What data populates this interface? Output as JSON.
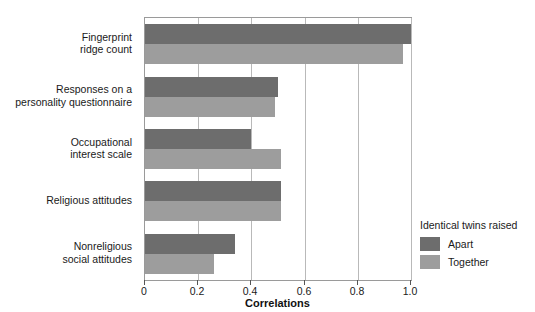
{
  "chart_data": {
    "type": "bar",
    "orientation": "horizontal",
    "title": "",
    "xlabel": "Correlations",
    "ylabel": "",
    "xlim": [
      0,
      1.0
    ],
    "xticks": [
      0,
      0.2,
      0.4,
      0.6,
      0.8,
      1.0
    ],
    "xticklabels": [
      "0",
      "0.2",
      "0.4",
      "0.6",
      "0.8",
      "1.0"
    ],
    "grid": "vertical",
    "legend_position": "right",
    "legend_title": "Identical twins raised",
    "categories": [
      "Fingerprint\nridge count",
      "Responses on a\npersonality questionnaire",
      "Occupational\ninterest scale",
      "Religious attitudes",
      "Nonreligious\nsocial attitudes"
    ],
    "series": [
      {
        "name": "Apart",
        "color": "#6d6d6d",
        "values": [
          1.0,
          0.5,
          0.4,
          0.51,
          0.34
        ]
      },
      {
        "name": "Together",
        "color": "#9d9d9d",
        "values": [
          0.97,
          0.49,
          0.51,
          0.51,
          0.26
        ]
      }
    ]
  },
  "legend": {
    "title": "Identical twins raised",
    "entries": [
      {
        "label": "Apart",
        "color": "#6d6d6d"
      },
      {
        "label": "Together",
        "color": "#9d9d9d"
      }
    ]
  },
  "axis": {
    "x_title": "Correlations",
    "tick_labels": [
      "0",
      "0.2",
      "0.4",
      "0.6",
      "0.8",
      "1.0"
    ]
  },
  "categories": [
    "Fingerprint\nridge count",
    "Responses on a\npersonality questionnaire",
    "Occupational\ninterest scale",
    "Religious attitudes",
    "Nonreligious\nsocial attitudes"
  ],
  "colors": {
    "apart": "#6d6d6d",
    "together": "#9d9d9d",
    "grid": "#b9b9b9",
    "axis": "#9a9a9a",
    "background": "#ffffff",
    "text": "#1a1a1a"
  }
}
